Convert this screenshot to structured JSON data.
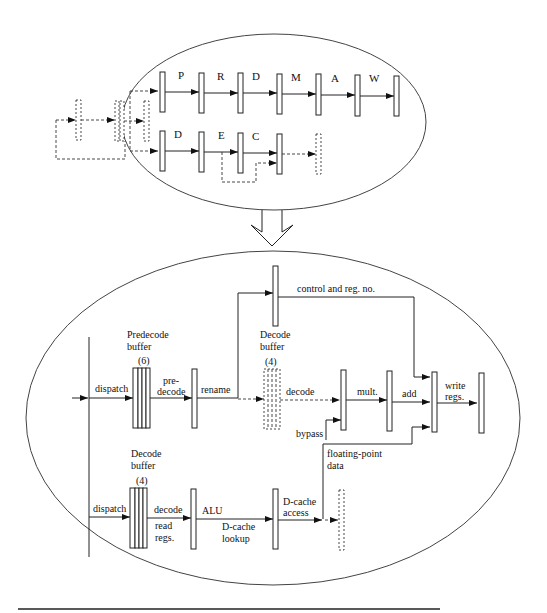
{
  "top_pipeline": {
    "upper_row_stages": [
      "P",
      "R",
      "D",
      "M",
      "A",
      "W"
    ],
    "lower_row_stages": [
      "D",
      "E",
      "C"
    ]
  },
  "bottom_pipeline": {
    "labels": {
      "predecode_buffer_title_1": "Predecode",
      "predecode_buffer_title_2": "buffer",
      "predecode_buffer_count": "(6)",
      "dispatch_top": "dispatch",
      "predecode_1": "pre-",
      "predecode_2": "decode",
      "rename": "rename",
      "control_reg": "control and reg. no.",
      "fp_decode_buffer_title_1": "Decode",
      "fp_decode_buffer_title_2": "buffer",
      "fp_decode_buffer_count": "(4)",
      "decode_fp": "decode",
      "mult": "mult.",
      "add": "add",
      "write_1": "write",
      "write_2": "regs.",
      "bypass": "bypass",
      "fp_data_1": "floating-point",
      "fp_data_2": "data",
      "int_decode_buffer_title_1": "Decode",
      "int_decode_buffer_title_2": "buffer",
      "int_decode_buffer_count": "(4)",
      "dispatch_bottom": "dispatch",
      "decode_int": "decode",
      "read_1": "read",
      "read_2": "regs.",
      "alu": "ALU",
      "dcache_lookup_1": "D-cache",
      "dcache_lookup_2": "lookup",
      "dcache_access_1": "D-cache",
      "dcache_access_2": "access"
    }
  },
  "colors": {
    "line": "#222222",
    "background": "#ffffff"
  }
}
